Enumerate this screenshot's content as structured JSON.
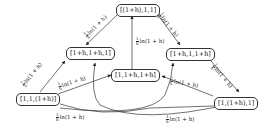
{
  "nodes": {
    "top": "[(1+h),1,1]",
    "left_upper": "[1+h,1+h,1]",
    "right_upper": "[1+h,1,1+h]",
    "center": "[1,1+h,1+h]",
    "left_lower": "[1,1,(1+h)]",
    "right_lower": "[1,(1+h),1]"
  },
  "edges": {
    "top_to_left_upper": {
      "num": "1",
      "den": "h",
      "text": "ln(1 + h)"
    },
    "top_to_right_upper": {
      "num": "1",
      "den": "h",
      "text": "ln(1 + h)"
    },
    "center_to_top": {
      "num": "1",
      "den": "h",
      "text": "ln(1 + h)"
    },
    "left_lower_to_left_upper": {
      "num": "1",
      "den": "h",
      "text": "ln(1 + h)"
    },
    "left_lower_to_center": {
      "num": "1",
      "den": "h",
      "text": "ln(1 + h)"
    },
    "right_upper_to_right_lower": {
      "num": "1",
      "den": "h",
      "text": "ln(1 + h)"
    },
    "right_lower_to_center": {
      "num": "1",
      "den": "h",
      "text": "ln(1 + h)"
    },
    "left_lower_to_right_lower": {
      "num": "1",
      "den": "h",
      "text": "ln(1 + h)"
    }
  }
}
